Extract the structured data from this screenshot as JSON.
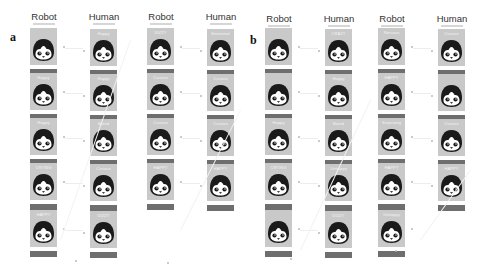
{
  "panels": [
    {
      "letter": "a",
      "columns": [
        {
          "header": "Robot",
          "labels": [
            "",
            "Happy",
            "Happy",
            "CRYING",
            "HAPPY"
          ]
        },
        {
          "header": "Human",
          "labels": [
            "Happy",
            "Happy",
            "Bored",
            "Curious",
            "DIZZY"
          ]
        },
        {
          "header": "Robot",
          "labels": [
            "DIZZY",
            "Curious",
            "Curious",
            "HAPPY"
          ]
        },
        {
          "header": "Human",
          "labels": [
            "Emotional",
            "Curious",
            "Curious",
            "HAPPY"
          ]
        }
      ]
    },
    {
      "letter": "b",
      "columns": [
        {
          "header": "Robot",
          "labels": [
            "",
            "",
            "Happy",
            "CRYING",
            ""
          ]
        },
        {
          "header": "Human",
          "labels": [
            "CRAZY",
            "Happy",
            "Bored",
            "Unhappy",
            "DIZZY"
          ]
        },
        {
          "header": "Robot",
          "labels": [
            "Nervous",
            "HAPPY",
            "Surprising",
            "HAPPY",
            "Unhappy"
          ]
        },
        {
          "header": "Human",
          "labels": [
            "Curious",
            "",
            "Curious",
            "HAPPY"
          ]
        }
      ]
    }
  ],
  "colors": {
    "card_box": "#c9c9c9",
    "card_bar": "#6e6e6e",
    "penguin_dark": "#1a1a1a",
    "penguin_face": "#ffffff",
    "beak": "#444444"
  }
}
